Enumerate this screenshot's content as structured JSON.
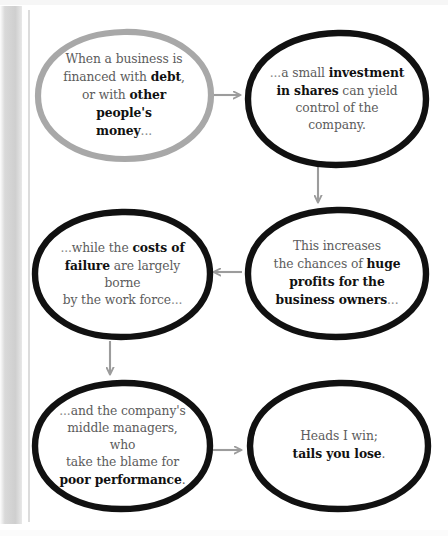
{
  "diagram": {
    "type": "flowchart",
    "colors": {
      "node_stroke_black": "#111111",
      "node_stroke_gray": "#a8a8a8",
      "arrow": "#9c9c9c",
      "body_text": "#5c5c5c",
      "bold_text": "#111111",
      "background": "#ffffff"
    },
    "nodes": [
      {
        "id": "node-1",
        "name": "node-financed-with-debt",
        "stroke": "gray",
        "lines": [
          {
            "segments": [
              {
                "text": "When a business is",
                "bold": false
              }
            ]
          },
          {
            "segments": [
              {
                "text": "financed with ",
                "bold": false
              },
              {
                "text": "debt",
                "bold": true
              },
              {
                "text": ",",
                "bold": false
              }
            ]
          },
          {
            "segments": [
              {
                "text": "or with ",
                "bold": false
              },
              {
                "text": "other people's",
                "bold": true
              }
            ]
          },
          {
            "segments": [
              {
                "text": "money",
                "bold": true
              },
              {
                "text": "...",
                "bold": false,
                "dim": true
              }
            ]
          }
        ],
        "plain": "When a business is financed with debt, or with other people's money..."
      },
      {
        "id": "node-2",
        "name": "node-small-investment-in-shares",
        "stroke": "black",
        "lines": [
          {
            "segments": [
              {
                "text": "...",
                "bold": false,
                "dim": true
              },
              {
                "text": "a small ",
                "bold": false
              },
              {
                "text": "investment",
                "bold": true
              }
            ]
          },
          {
            "segments": [
              {
                "text": "in shares",
                "bold": true
              },
              {
                "text": " can yield",
                "bold": false
              }
            ]
          },
          {
            "segments": [
              {
                "text": "control of the company.",
                "bold": false
              }
            ]
          }
        ],
        "plain": "...a small investment in shares can yield control of the company."
      },
      {
        "id": "node-3",
        "name": "node-huge-profits-business-owners",
        "stroke": "black",
        "lines": [
          {
            "segments": [
              {
                "text": "This increases",
                "bold": false
              }
            ]
          },
          {
            "segments": [
              {
                "text": "the chances of ",
                "bold": false
              },
              {
                "text": "huge",
                "bold": true
              }
            ]
          },
          {
            "segments": [
              {
                "text": "profits for the",
                "bold": true
              }
            ]
          },
          {
            "segments": [
              {
                "text": "business owners",
                "bold": true
              },
              {
                "text": "...",
                "bold": false,
                "dim": true
              }
            ]
          }
        ],
        "plain": "This increases the chances of huge profits for the business owners..."
      },
      {
        "id": "node-4",
        "name": "node-costs-of-failure-work-force",
        "stroke": "black",
        "lines": [
          {
            "segments": [
              {
                "text": "...",
                "bold": false,
                "dim": true
              },
              {
                "text": "while the ",
                "bold": false
              },
              {
                "text": "costs of",
                "bold": true
              }
            ]
          },
          {
            "segments": [
              {
                "text": "failure",
                "bold": true
              },
              {
                "text": " are largely borne",
                "bold": false
              }
            ]
          },
          {
            "segments": [
              {
                "text": "by the work force",
                "bold": false
              },
              {
                "text": "...",
                "bold": false,
                "dim": true
              }
            ]
          }
        ],
        "plain": "...while the costs of failure are largely borne by the work force..."
      },
      {
        "id": "node-5",
        "name": "node-middle-managers-poor-performance",
        "stroke": "black",
        "lines": [
          {
            "segments": [
              {
                "text": "...",
                "bold": false,
                "dim": true
              },
              {
                "text": "and the company's",
                "bold": false
              }
            ]
          },
          {
            "segments": [
              {
                "text": "middle managers, who",
                "bold": false
              }
            ]
          },
          {
            "segments": [
              {
                "text": "take the blame for",
                "bold": false
              }
            ]
          },
          {
            "segments": [
              {
                "text": "poor performance",
                "bold": true
              },
              {
                "text": ".",
                "bold": false
              }
            ]
          }
        ],
        "plain": "...and the company's middle managers, who take the blame for poor performance."
      },
      {
        "id": "node-6",
        "name": "node-heads-i-win-tails-you-lose",
        "stroke": "black",
        "lines": [
          {
            "segments": [
              {
                "text": "Heads I win;",
                "bold": false
              }
            ]
          },
          {
            "segments": [
              {
                "text": "tails you lose",
                "bold": true
              },
              {
                "text": ".",
                "bold": false
              }
            ]
          }
        ],
        "plain": "Heads I win; tails you lose."
      }
    ],
    "arrows": [
      {
        "name": "arrow-node1-to-node2",
        "direction": "right",
        "from": "node-1",
        "to": "node-2"
      },
      {
        "name": "arrow-node2-to-node3",
        "direction": "down",
        "from": "node-2",
        "to": "node-3"
      },
      {
        "name": "arrow-node3-to-node4",
        "direction": "left",
        "from": "node-3",
        "to": "node-4"
      },
      {
        "name": "arrow-node4-to-node5",
        "direction": "down",
        "from": "node-4",
        "to": "node-5"
      },
      {
        "name": "arrow-node5-to-node6",
        "direction": "right",
        "from": "node-5",
        "to": "node-6"
      }
    ]
  }
}
